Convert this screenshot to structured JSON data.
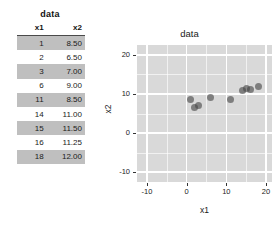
{
  "table": {
    "title": "data",
    "columns": [
      "x1",
      "x2"
    ],
    "rows": [
      {
        "x1": "1",
        "x2": "8.50"
      },
      {
        "x1": "2",
        "x2": "6.50"
      },
      {
        "x1": "3",
        "x2": "7.00"
      },
      {
        "x1": "6",
        "x2": "9.00"
      },
      {
        "x1": "11",
        "x2": "8.50"
      },
      {
        "x1": "14",
        "x2": "11.00"
      },
      {
        "x1": "15",
        "x2": "11.50"
      },
      {
        "x1": "16",
        "x2": "11.25"
      },
      {
        "x1": "18",
        "x2": "12.00"
      }
    ]
  },
  "chart_data": {
    "type": "scatter",
    "title": "data",
    "xlabel": "x1",
    "ylabel": "x2",
    "x": [
      1,
      2,
      3,
      6,
      11,
      14,
      15,
      16,
      18
    ],
    "y": [
      8.5,
      6.5,
      7.0,
      9.0,
      8.5,
      11.0,
      11.5,
      11.25,
      12.0
    ],
    "xlim": [
      -12.5,
      21.5
    ],
    "ylim": [
      -12.5,
      22.5
    ],
    "xticks": [
      -10,
      0,
      10,
      20
    ],
    "yticks": [
      -10,
      0,
      10,
      20
    ],
    "xtick_labels": [
      "-10",
      "0",
      "10",
      "20"
    ],
    "ytick_labels": [
      "-10",
      "0",
      "10",
      "20"
    ],
    "x_minor_ticks": [
      -5,
      5,
      15
    ],
    "y_minor_ticks": [
      -5,
      5,
      15
    ],
    "grid": true,
    "legend": false,
    "panel_background": "#d9d9d9",
    "gridline_color": "#ffffff",
    "point_color": "#464646"
  }
}
